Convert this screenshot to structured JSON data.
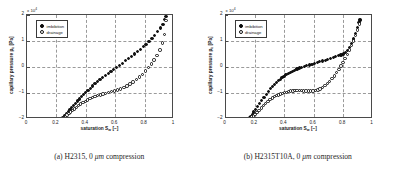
{
  "figure": {
    "panels": [
      {
        "caption_label": "(a)",
        "caption_text": "H2315, 0 μm compression",
        "chart": {
          "exponent_prefix": "x 10",
          "exponent_power": "4"
        }
      },
      {
        "caption_label": "(b)",
        "caption_text": "H2315T10A, 0 μm compression",
        "chart": {
          "exponent_prefix": "x 10",
          "exponent_power": "4"
        }
      }
    ],
    "legend": {
      "imbibition": "imbibition",
      "drainage": "drainage"
    },
    "axis": {
      "xlabel_main": "saturation S",
      "xlabel_sub": "w",
      "xlabel_unit": " [−]",
      "ylabel_main": "capillary pressure p",
      "ylabel_sub": "c",
      "ylabel_unit": " [Pa]",
      "xticks": [
        "0",
        "0.2",
        "0.4",
        "0.6",
        "0.8",
        "1"
      ],
      "yticks": [
        "2",
        "1",
        "0",
        "−1",
        "−2"
      ]
    },
    "colors": {
      "marker_filled": "#111111",
      "marker_open_edge": "#111111",
      "axis": "#4a4a4a",
      "grid": "#9a9a9a",
      "background": "#ffffff"
    }
  },
  "chart_data": [
    {
      "type": "scatter",
      "title": "(a) H2315, 0 μm compression",
      "xlabel": "saturation S_w [-]",
      "ylabel": "capillary pressure p_c [Pa]",
      "xlim": [
        0,
        1
      ],
      "ylim": [
        -20000,
        20000
      ],
      "y_scale_factor": 10000,
      "xticks": [
        0,
        0.2,
        0.4,
        0.6,
        0.8,
        1
      ],
      "yticks": [
        -20000,
        -10000,
        0,
        10000,
        20000
      ],
      "grid": true,
      "legend_position": "upper left",
      "series": [
        {
          "name": "imbibition",
          "marker": "filled-circle",
          "x": [
            0.245,
            0.255,
            0.268,
            0.28,
            0.293,
            0.305,
            0.318,
            0.33,
            0.345,
            0.358,
            0.372,
            0.385,
            0.4,
            0.415,
            0.43,
            0.447,
            0.463,
            0.48,
            0.497,
            0.515,
            0.533,
            0.552,
            0.571,
            0.59,
            0.61,
            0.63,
            0.65,
            0.67,
            0.69,
            0.71,
            0.73,
            0.75,
            0.77,
            0.79,
            0.81,
            0.83,
            0.85,
            0.87,
            0.89,
            0.91,
            0.925,
            0.938,
            0.945
          ],
          "y": [
            -19500,
            -18800,
            -18000,
            -17200,
            -16400,
            -15600,
            -14800,
            -14000,
            -13100,
            -12300,
            -11500,
            -10700,
            -9800,
            -9000,
            -8200,
            -7300,
            -6500,
            -5700,
            -4900,
            -4100,
            -3300,
            -2500,
            -1700,
            -900,
            -100,
            700,
            1500,
            2400,
            3200,
            4100,
            5000,
            5900,
            6800,
            7800,
            8800,
            9900,
            11000,
            12200,
            13500,
            15000,
            16500,
            18200,
            19300
          ]
        },
        {
          "name": "drainage",
          "marker": "open-circle",
          "x": [
            0.248,
            0.26,
            0.272,
            0.285,
            0.298,
            0.311,
            0.324,
            0.338,
            0.352,
            0.366,
            0.381,
            0.396,
            0.412,
            0.428,
            0.445,
            0.462,
            0.48,
            0.498,
            0.517,
            0.536,
            0.556,
            0.576,
            0.596,
            0.617,
            0.638,
            0.659,
            0.68,
            0.701,
            0.722,
            0.743,
            0.764,
            0.785,
            0.805,
            0.825,
            0.845,
            0.865,
            0.885,
            0.905,
            0.922,
            0.936,
            0.945
          ],
          "y": [
            -19600,
            -19100,
            -18500,
            -17900,
            -17300,
            -16700,
            -16100,
            -15500,
            -14900,
            -14300,
            -13700,
            -13200,
            -12700,
            -12200,
            -11800,
            -11400,
            -11000,
            -10700,
            -10400,
            -10100,
            -9800,
            -9500,
            -9200,
            -8800,
            -8400,
            -7900,
            -7300,
            -6600,
            -5800,
            -4900,
            -3900,
            -2800,
            -1600,
            -300,
            1100,
            2700,
            4500,
            6600,
            9200,
            12500,
            17800
          ]
        }
      ]
    },
    {
      "type": "scatter",
      "title": "(b) H2315T10A, 0 μm compression",
      "xlabel": "saturation S_w [-]",
      "ylabel": "capillary pressure p_c [Pa]",
      "xlim": [
        0,
        1
      ],
      "ylim": [
        -20000,
        20000
      ],
      "y_scale_factor": 10000,
      "xticks": [
        0,
        0.2,
        0.4,
        0.6,
        0.8,
        1
      ],
      "yticks": [
        -20000,
        -10000,
        0,
        10000,
        20000
      ],
      "grid": true,
      "legend_position": "upper left",
      "series": [
        {
          "name": "imbibition",
          "marker": "filled-circle",
          "x": [
            0.163,
            0.172,
            0.182,
            0.193,
            0.205,
            0.218,
            0.232,
            0.247,
            0.262,
            0.277,
            0.292,
            0.307,
            0.32,
            0.333,
            0.346,
            0.359,
            0.372,
            0.385,
            0.398,
            0.412,
            0.426,
            0.44,
            0.455,
            0.47,
            0.486,
            0.502,
            0.518,
            0.535,
            0.552,
            0.57,
            0.588,
            0.606,
            0.624,
            0.642,
            0.66,
            0.678,
            0.696,
            0.714,
            0.732,
            0.75,
            0.768,
            0.786,
            0.8,
            0.814,
            0.828,
            0.842,
            0.856,
            0.87,
            0.884,
            0.898,
            0.908,
            0.915
          ],
          "y": [
            -19600,
            -19000,
            -18200,
            -17300,
            -16300,
            -15200,
            -14000,
            -12800,
            -11600,
            -10500,
            -9400,
            -8400,
            -7500,
            -6700,
            -6000,
            -5300,
            -4700,
            -4100,
            -3500,
            -3000,
            -2500,
            -2000,
            -1600,
            -1200,
            -800,
            -400,
            -100,
            200,
            500,
            800,
            1100,
            1400,
            1700,
            2000,
            2300,
            2600,
            3000,
            3400,
            3700,
            4000,
            4300,
            4600,
            5000,
            5600,
            6400,
            7500,
            9000,
            10800,
            12900,
            15200,
            17000,
            18100
          ]
        },
        {
          "name": "drainage",
          "marker": "open-circle",
          "x": [
            0.168,
            0.178,
            0.189,
            0.201,
            0.214,
            0.228,
            0.243,
            0.258,
            0.273,
            0.288,
            0.303,
            0.318,
            0.332,
            0.346,
            0.36,
            0.374,
            0.388,
            0.402,
            0.416,
            0.43,
            0.444,
            0.458,
            0.472,
            0.487,
            0.502,
            0.517,
            0.532,
            0.548,
            0.564,
            0.58,
            0.596,
            0.612,
            0.628,
            0.644,
            0.66,
            0.676,
            0.692,
            0.708,
            0.724,
            0.74,
            0.756,
            0.772,
            0.786,
            0.8,
            0.814,
            0.828,
            0.842,
            0.856,
            0.87,
            0.884,
            0.898,
            0.91
          ],
          "y": [
            -19700,
            -19300,
            -18800,
            -18200,
            -17500,
            -16700,
            -15800,
            -14900,
            -14000,
            -13200,
            -12500,
            -11900,
            -11400,
            -11000,
            -10700,
            -10400,
            -10100,
            -9900,
            -9700,
            -9500,
            -9300,
            -9200,
            -9150,
            -9100,
            -9100,
            -9150,
            -9200,
            -9250,
            -9300,
            -9300,
            -9250,
            -9100,
            -8800,
            -8400,
            -7900,
            -7200,
            -6400,
            -5500,
            -4500,
            -3400,
            -2200,
            -900,
            400,
            1800,
            3300,
            4900,
            6500,
            8200,
            10000,
            12000,
            14200,
            16500
          ]
        }
      ]
    }
  ]
}
